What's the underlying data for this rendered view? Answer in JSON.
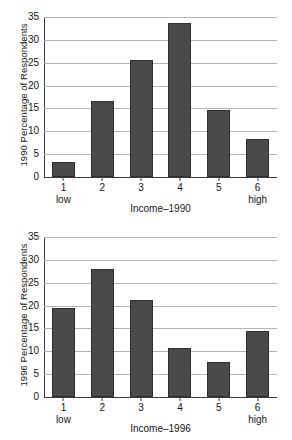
{
  "chart_data": [
    {
      "type": "bar",
      "title": "",
      "xlabel": "Income–1990",
      "ylabel": "1990 Percentage of Respondents",
      "categories": [
        "1",
        "2",
        "3",
        "4",
        "5",
        "6"
      ],
      "category_sublabels": [
        "low",
        "",
        "",
        "",
        "",
        "high"
      ],
      "values": [
        3.2,
        16.6,
        25.7,
        33.7,
        14.6,
        8.3
      ],
      "ylim": [
        0,
        35
      ],
      "yticks": [
        0,
        5,
        10,
        15,
        20,
        25,
        30,
        35
      ],
      "ytick_labels": [
        "0",
        "5",
        "10",
        "15",
        "20",
        "25",
        "30",
        "35"
      ],
      "grid": true,
      "legend": "none",
      "bar_color": "#4a4a4a"
    },
    {
      "type": "bar",
      "title": "",
      "xlabel": "Income–1996",
      "ylabel": "1996 Percentage of Respondents",
      "categories": [
        "1",
        "2",
        "3",
        "4",
        "5",
        "6"
      ],
      "category_sublabels": [
        "low",
        "",
        "",
        "",
        "",
        "high"
      ],
      "values": [
        19.5,
        28.0,
        21.3,
        10.8,
        7.6,
        14.4
      ],
      "ylim": [
        0,
        35
      ],
      "yticks": [
        0,
        5,
        10,
        15,
        20,
        25,
        30,
        35
      ],
      "ytick_labels": [
        "0",
        "5",
        "10",
        "15",
        "20",
        "25",
        "30",
        "35"
      ],
      "grid": true,
      "legend": "none",
      "bar_color": "#4a4a4a"
    }
  ]
}
